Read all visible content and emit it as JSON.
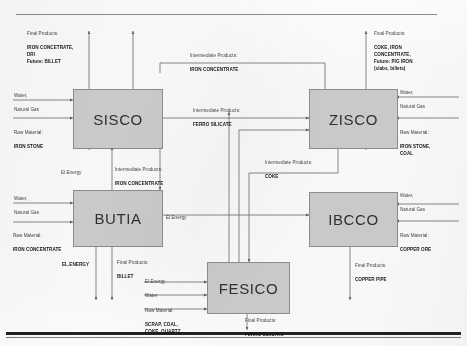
{
  "diagram": {
    "type": "block-flow-diagram",
    "nodes": [
      {
        "id": "sisco",
        "label": "SISCO"
      },
      {
        "id": "zisco",
        "label": "ZISCO"
      },
      {
        "id": "butia",
        "label": "BUTIA"
      },
      {
        "id": "ibcco",
        "label": "IBCCO"
      },
      {
        "id": "fesico",
        "label": "FESICO"
      }
    ],
    "labels": {
      "sisco_final_products": {
        "caption": "Final Products:",
        "value": "IRON CONCETRATE,\nDRI\nFuture: BILLET"
      },
      "sisco_water": {
        "caption": "Water,",
        "value": "Natural Gas"
      },
      "sisco_raw": {
        "caption": "Raw Material:",
        "value": "IRON STONE"
      },
      "zisco_final_products": {
        "caption": "Final Products:",
        "value": "COKE, IRON\nCONCENTRATE,\nFuture: PIG IRON\n(slabs, billets)"
      },
      "zisco_water": {
        "caption": "Water,",
        "value": "Natural Gas"
      },
      "zisco_raw": {
        "caption": "Raw Material:",
        "value": "IRON STONE,\nCOAL"
      },
      "butia_water": {
        "caption": "Water,",
        "value": "Natural Gas"
      },
      "butia_raw": {
        "caption": "Raw Material:",
        "value": "IRON CONCENTRATE"
      },
      "butia_elenergy_out": {
        "caption": "",
        "value": "EL.ENERGY"
      },
      "butia_final_products": {
        "caption": "Final Products:",
        "value": "BILLET"
      },
      "ibcco_water": {
        "caption": "Water,",
        "value": "Natural Gas"
      },
      "ibcco_raw": {
        "caption": "Raw Material:",
        "value": "COPPER ORE"
      },
      "ibcco_final_products": {
        "caption": "Final Products:",
        "value": "COPPER PIPE"
      },
      "fesico_elenergy_in": {
        "caption": "El.Energy",
        "value": ""
      },
      "fesico_water_in": {
        "caption": "Water",
        "value": ""
      },
      "fesico_raw": {
        "caption": "Raw Material:",
        "value": "SCRAP, COAL,\nCOKE, QUARTZ,"
      },
      "fesico_final_products": {
        "caption": "Final Products:",
        "value": "FERRO SILICATE"
      },
      "flow_iron_concentrate_top": {
        "caption": "Intermediate  Products:",
        "value": "IRON CONCENTRATE"
      },
      "flow_ferro_silicate": {
        "caption": "Intermediate  Products:",
        "value": "FERRO SILICATE"
      },
      "flow_coke": {
        "caption": "Intermediate  Products:",
        "value": "COKE"
      },
      "flow_iron_concentrate_butia": {
        "caption": "Intermediate  Products:",
        "value": "IRON CONCENTRATE"
      },
      "flow_elenergy_sisco": {
        "caption": "El.Energy",
        "value": ""
      },
      "flow_elenergy_ibcco": {
        "caption": "El.Energy",
        "value": ""
      }
    }
  }
}
